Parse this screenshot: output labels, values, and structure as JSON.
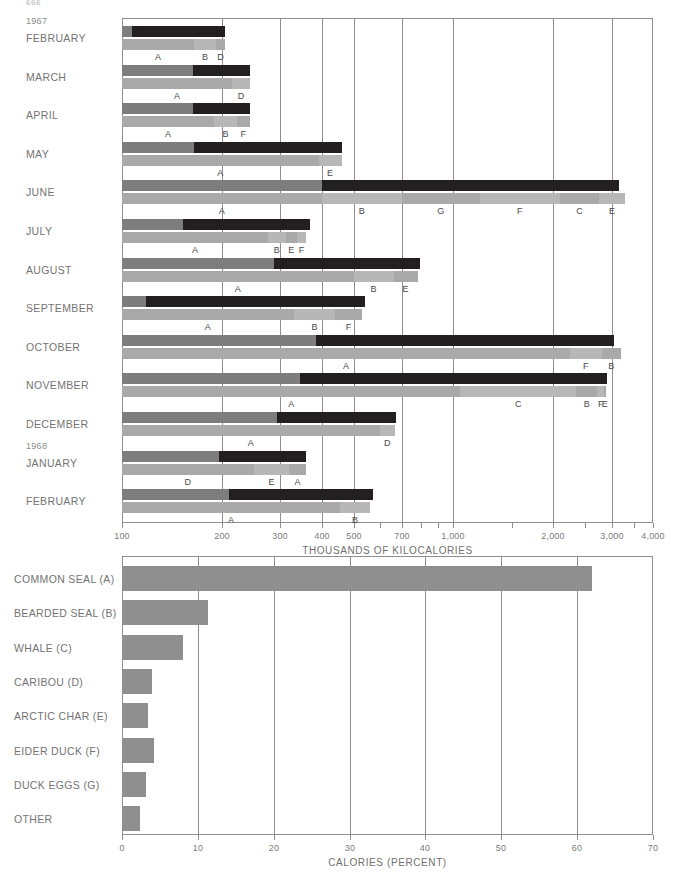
{
  "page": {
    "folio": "666"
  },
  "top_chart": {
    "axis_title": "THOUSANDS OF KILOCALORIES",
    "ticks": [
      100,
      200,
      300,
      400,
      500,
      700,
      1000,
      2000,
      3000,
      4000
    ],
    "tick_labels": [
      "100",
      "200",
      "300",
      "400",
      "500",
      "700",
      "1,000",
      "2,000",
      "3,000",
      "4,000"
    ],
    "minor_ticks": [
      600,
      800,
      900,
      1500,
      2500,
      3500
    ],
    "gridlines": [
      200,
      300,
      400,
      500,
      700,
      1000,
      2000,
      3000
    ],
    "year_markers": [
      {
        "label": "1967",
        "row": 0
      },
      {
        "label": "1968",
        "row": 11
      }
    ],
    "colors": {
      "dark": "#231f20",
      "mid": "#7d7d7d",
      "light": "#a9a9a9",
      "light2": "#b7b7b7",
      "grid": "#8e8e8e"
    }
  },
  "chart_data": [
    {
      "type": "bar",
      "title": "Monthly energy yield of the hunt",
      "subtitle": "Upper bar: total kilocalories obtained (dark) against effort (grey). Lower bar: composition by species.",
      "xlabel": "THOUSANDS OF KILOCALORIES",
      "ylabel": "",
      "xscale": "log",
      "xlim": [
        100,
        4000
      ],
      "xticks": [
        100,
        200,
        300,
        400,
        500,
        700,
        1000,
        2000,
        3000,
        4000
      ],
      "grid": true,
      "legend": "below-bar letter codes A-G",
      "categories": [
        "FEBRUARY",
        "MARCH",
        "APRIL",
        "MAY",
        "JUNE",
        "JULY",
        "AUGUST",
        "SEPTEMBER",
        "OCTOBER",
        "NOVEMBER",
        "DECEMBER",
        "JANUARY",
        "FEBRUARY"
      ],
      "rows": [
        {
          "month": "FEBRUARY",
          "year": "1967",
          "upper_total": 205,
          "upper_grey_end": 107,
          "lower_total": 205,
          "segments": [
            {
              "code": "A",
              "end": 165,
              "shade": "light"
            },
            {
              "code": "B",
              "end": 192,
              "shade": "light2"
            },
            {
              "code": "D",
              "end": 205,
              "shade": "light"
            }
          ]
        },
        {
          "month": "MARCH",
          "year": "",
          "upper_total": 243,
          "upper_grey_end": 164,
          "lower_total": 243,
          "segments": [
            {
              "code": "A",
              "end": 215,
              "shade": "light"
            },
            {
              "code": "D",
              "end": 243,
              "shade": "light2"
            }
          ]
        },
        {
          "month": "APRIL",
          "year": "",
          "upper_total": 243,
          "upper_grey_end": 164,
          "lower_total": 243,
          "segments": [
            {
              "code": "A",
              "end": 190,
              "shade": "light"
            },
            {
              "code": "B",
              "end": 222,
              "shade": "light2"
            },
            {
              "code": "F",
              "end": 243,
              "shade": "light"
            }
          ]
        },
        {
          "month": "MAY",
          "year": "",
          "upper_total": 460,
          "upper_grey_end": 165,
          "lower_total": 460,
          "segments": [
            {
              "code": "A",
              "end": 392,
              "shade": "light"
            },
            {
              "code": "E",
              "end": 460,
              "shade": "light2"
            }
          ]
        },
        {
          "month": "JUNE",
          "year": "",
          "upper_total": 3150,
          "upper_grey_end": 400,
          "lower_total": 3300,
          "segments": [
            {
              "code": "A",
              "end": 400,
              "shade": "light"
            },
            {
              "code": "B",
              "end": 700,
              "shade": "light2"
            },
            {
              "code": "G",
              "end": 1200,
              "shade": "light"
            },
            {
              "code": "F",
              "end": 2100,
              "shade": "light2"
            },
            {
              "code": "C",
              "end": 2750,
              "shade": "light"
            },
            {
              "code": "E",
              "end": 3300,
              "shade": "light2"
            }
          ]
        },
        {
          "month": "JULY",
          "year": "",
          "upper_total": 370,
          "upper_grey_end": 153,
          "lower_total": 360,
          "segments": [
            {
              "code": "A",
              "end": 276,
              "shade": "light"
            },
            {
              "code": "B",
              "end": 312,
              "shade": "light2"
            },
            {
              "code": "E",
              "end": 337,
              "shade": "light"
            },
            {
              "code": "F",
              "end": 360,
              "shade": "light2"
            }
          ]
        },
        {
          "month": "AUGUST",
          "year": "",
          "upper_total": 790,
          "upper_grey_end": 287,
          "lower_total": 780,
          "segments": [
            {
              "code": "A",
              "end": 500,
              "shade": "light"
            },
            {
              "code": "B",
              "end": 660,
              "shade": "light2"
            },
            {
              "code": "E",
              "end": 780,
              "shade": "light"
            }
          ]
        },
        {
          "month": "SEPTEMBER",
          "year": "",
          "upper_total": 540,
          "upper_grey_end": 118,
          "lower_total": 530,
          "segments": [
            {
              "code": "A",
              "end": 330,
              "shade": "light"
            },
            {
              "code": "B",
              "end": 440,
              "shade": "light2"
            },
            {
              "code": "F",
              "end": 530,
              "shade": "light"
            }
          ]
        },
        {
          "month": "OCTOBER",
          "year": "",
          "upper_total": 3050,
          "upper_grey_end": 385,
          "lower_total": 3200,
          "segments": [
            {
              "code": "A",
              "end": 2250,
              "shade": "light"
            },
            {
              "code": "F",
              "end": 2800,
              "shade": "light2"
            },
            {
              "code": "B",
              "end": 3200,
              "shade": "light"
            }
          ]
        },
        {
          "month": "NOVEMBER",
          "year": "",
          "upper_total": 2900,
          "upper_grey_end": 345,
          "lower_total": 2880,
          "segments": [
            {
              "code": "A",
              "end": 1050,
              "shade": "light"
            },
            {
              "code": "C",
              "end": 2350,
              "shade": "light2"
            },
            {
              "code": "B",
              "end": 2720,
              "shade": "light"
            },
            {
              "code": "F",
              "end": 2850,
              "shade": "light2"
            },
            {
              "code": "E",
              "end": 2880,
              "shade": "light"
            }
          ]
        },
        {
          "month": "DECEMBER",
          "year": "",
          "upper_total": 670,
          "upper_grey_end": 293,
          "lower_total": 665,
          "segments": [
            {
              "code": "A",
              "end": 600,
              "shade": "light"
            },
            {
              "code": "D",
              "end": 665,
              "shade": "light2"
            }
          ]
        },
        {
          "month": "JANUARY",
          "year": "1968",
          "upper_total": 360,
          "upper_grey_end": 196,
          "lower_total": 358,
          "segments": [
            {
              "code": "D",
              "end": 250,
              "shade": "light"
            },
            {
              "code": "E",
              "end": 320,
              "shade": "light2"
            },
            {
              "code": "A",
              "end": 358,
              "shade": "light"
            }
          ]
        },
        {
          "month": "FEBRUARY",
          "year": "",
          "upper_total": 570,
          "upper_grey_end": 210,
          "lower_total": 560,
          "segments": [
            {
              "code": "A",
              "end": 455,
              "shade": "light"
            },
            {
              "code": "B",
              "end": 560,
              "shade": "light2"
            }
          ]
        }
      ]
    },
    {
      "type": "bar",
      "orientation": "horizontal",
      "title": "Share of total calories by species",
      "xlabel": "CALORIES (PERCENT)",
      "ylabel": "",
      "xscale": "linear",
      "xlim": [
        0,
        70
      ],
      "xticks": [
        0,
        10,
        20,
        30,
        40,
        50,
        60,
        70
      ],
      "grid": true,
      "categories": [
        "COMMON SEAL (A)",
        "BEARDED SEAL (B)",
        "WHALE (C)",
        "CARIBOU (D)",
        "ARCTIC CHAR (E)",
        "EIDER DUCK (F)",
        "DUCK EGGS (G)",
        "OTHER"
      ],
      "values": [
        62.0,
        11.3,
        8.1,
        4.0,
        3.4,
        4.2,
        3.1,
        2.4
      ],
      "bar_color": "#8f8f8f"
    }
  ],
  "legend_codes": {
    "A": "COMMON SEAL",
    "B": "BEARDED SEAL",
    "C": "WHALE",
    "D": "CARIBOU",
    "E": "ARCTIC CHAR",
    "F": "EIDER DUCK",
    "G": "DUCK EGGS"
  }
}
